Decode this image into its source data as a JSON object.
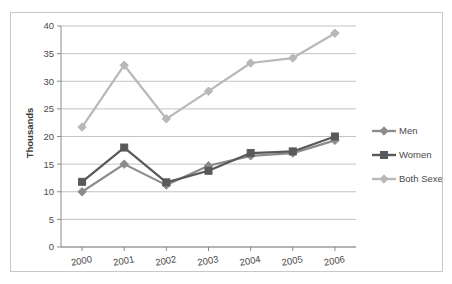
{
  "chart_data": {
    "type": "line",
    "title": "",
    "xlabel": "",
    "ylabel": "Thousands",
    "categories": [
      "2000",
      "2001",
      "2002",
      "2003",
      "2004",
      "2005",
      "2006"
    ],
    "x": [
      2000,
      2001,
      2002,
      2003,
      2004,
      2005,
      2006
    ],
    "series": [
      {
        "name": "Men",
        "color": "#8c8c8c",
        "marker": "diamond",
        "values": [
          10.0,
          15.0,
          11.2,
          14.7,
          16.5,
          17.0,
          19.3
        ]
      },
      {
        "name": "Women",
        "color": "#595959",
        "marker": "square",
        "values": [
          11.8,
          18.0,
          11.7,
          13.8,
          17.0,
          17.3,
          20.0
        ]
      },
      {
        "name": "Both Sexes",
        "color": "#b8b8b8",
        "marker": "diamond",
        "values": [
          21.7,
          32.9,
          23.2,
          28.2,
          33.3,
          34.2,
          38.7
        ]
      }
    ],
    "ylim": [
      0,
      40
    ],
    "ytick_values": [
      0,
      5,
      10,
      15,
      20,
      25,
      30,
      35,
      40
    ],
    "ytick_labels": [
      "0",
      "5",
      "10",
      "15",
      "20",
      "25",
      "30",
      "35",
      "40"
    ],
    "grid": true,
    "grid_axis": "y",
    "legend_position": "right",
    "legend": [
      {
        "label": "Men",
        "color": "#8c8c8c",
        "marker": "diamond"
      },
      {
        "label": "Women",
        "color": "#595959",
        "marker": "square"
      },
      {
        "label": "Both Sexes",
        "color": "#b8b8b8",
        "marker": "diamond"
      }
    ]
  },
  "colors": {
    "men": "#8c8c8c",
    "women": "#595959",
    "both_sexes": "#b8b8b8",
    "gridline": "#a9a9a9",
    "axis": "#808080",
    "frame": "#c8c8c8",
    "text": "#4a4a4a",
    "background": "#ffffff"
  }
}
